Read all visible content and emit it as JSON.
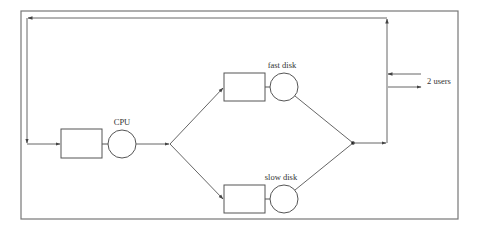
{
  "diagram": {
    "type": "queueing-network",
    "colors": {
      "stroke": "#555555",
      "border": "#777777",
      "background": "#ffffff",
      "text": "#333333"
    },
    "nodes": {
      "cpu": {
        "label": "CPU"
      },
      "fast_disk": {
        "label": "fast disk"
      },
      "slow_disk": {
        "label": "slow disk"
      }
    },
    "population": {
      "label": "2 users"
    }
  }
}
